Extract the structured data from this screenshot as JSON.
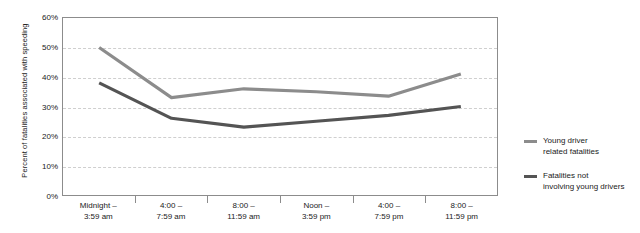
{
  "chart_data": {
    "type": "line",
    "title": "",
    "xlabel": "",
    "ylabel": "Percent of fatalities associated with speeding",
    "ylim": [
      0,
      60
    ],
    "ytick_labels": [
      "60%",
      "50%",
      "40%",
      "30%",
      "20%",
      "10%",
      "0%"
    ],
    "ytick_values": [
      60,
      50,
      40,
      30,
      20,
      10,
      0
    ],
    "grid": true,
    "legend_position": "right",
    "categories": [
      "Midnight – 3:59 am",
      "4:00 – 7:59 am",
      "8:00 – 11:59 am",
      "Noon – 3:59 pm",
      "4:00 – 7:59 pm",
      "8:00 – 11:59 pm"
    ],
    "category_lines": [
      [
        "Midnight –",
        "3:59 am"
      ],
      [
        "4:00 –",
        "7:59 am"
      ],
      [
        "8:00 –",
        "11:59 am"
      ],
      [
        "Noon –",
        "3:59 pm"
      ],
      [
        "4:00 –",
        "7:59 pm"
      ],
      [
        "8:00 –",
        "11:59 pm"
      ]
    ],
    "series": [
      {
        "name": "Young driver related fatalities",
        "name_lines": [
          "Young driver",
          "related fatalities"
        ],
        "color": "#8c8c8c",
        "values": [
          50,
          33,
          36,
          35,
          33.5,
          41
        ]
      },
      {
        "name": "Fatalities not involving young drivers",
        "name_lines": [
          "Fatalities not",
          "involving young drivers"
        ],
        "color": "#545454",
        "values": [
          38,
          26,
          23,
          25,
          27,
          30
        ]
      }
    ]
  }
}
